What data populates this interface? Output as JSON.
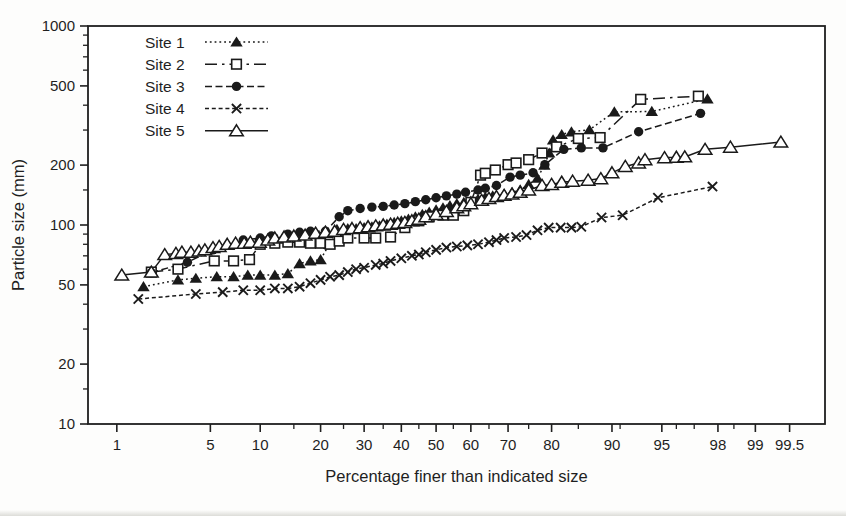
{
  "chart_data": {
    "type": "line",
    "title": "",
    "xlabel": "Percentage finer than indicated size",
    "ylabel": "Particle size (mm)",
    "x_scale": "normal-probability",
    "y_scale": "log",
    "xlim": [
      0.56,
      99.77
    ],
    "ylim": [
      10,
      1000
    ],
    "x_ticks_major": [
      1,
      5,
      10,
      20,
      30,
      40,
      50,
      60,
      70,
      80,
      90,
      95,
      98,
      99,
      99.5
    ],
    "x_tick_labels": [
      "1",
      "5",
      "10",
      "20",
      "30",
      "40",
      "50",
      "60",
      "70",
      "80",
      "90",
      "95",
      "98",
      "99",
      "99.5"
    ],
    "x_ticks_minor": [
      15,
      25,
      35,
      45,
      55,
      65,
      75,
      85,
      91,
      96,
      97,
      98.5
    ],
    "y_ticks_major": [
      10,
      20,
      50,
      100,
      200,
      500,
      1000
    ],
    "y_tick_labels": [
      "10",
      "20",
      "50",
      "100",
      "200",
      "500",
      "1000"
    ],
    "y_ticks_minor": [
      15,
      30,
      40,
      60,
      70,
      80,
      90,
      150,
      300,
      400,
      600,
      700,
      800,
      900
    ],
    "grid": false,
    "legend": {
      "position": "top-left-inside",
      "entries": [
        "Site 1",
        "Site 2",
        "Site 3",
        "Site 4",
        "Site 5"
      ]
    },
    "colors": {
      "series": "#1a1a1a",
      "axis": "#1f1f1f",
      "background": "#fdfdfc",
      "marker_open_fill": "#ffffff"
    },
    "series": [
      {
        "name": "Site 1",
        "marker": "triangle-filled",
        "line": "dotted",
        "points": [
          [
            1.65,
            49
          ],
          [
            3,
            53
          ],
          [
            4,
            54
          ],
          [
            5.5,
            55
          ],
          [
            7,
            55
          ],
          [
            8.5,
            56
          ],
          [
            10,
            56
          ],
          [
            12,
            56
          ],
          [
            14,
            57
          ],
          [
            16,
            64
          ],
          [
            18,
            66
          ],
          [
            20,
            67
          ],
          [
            21.8,
            80
          ],
          [
            23.5,
            95
          ],
          [
            26,
            96
          ],
          [
            28,
            96
          ],
          [
            30,
            97
          ],
          [
            32,
            98
          ],
          [
            34,
            99
          ],
          [
            36,
            101
          ],
          [
            38,
            103
          ],
          [
            40,
            105
          ],
          [
            42,
            107
          ],
          [
            44,
            110
          ],
          [
            46,
            113
          ],
          [
            48,
            116
          ],
          [
            50,
            119
          ],
          [
            52,
            122
          ],
          [
            54,
            125
          ],
          [
            56,
            128
          ],
          [
            58,
            130
          ],
          [
            60,
            132
          ],
          [
            62,
            135
          ],
          [
            64,
            138
          ],
          [
            66,
            140
          ],
          [
            69,
            143
          ],
          [
            71,
            146
          ],
          [
            73,
            150
          ],
          [
            75,
            160
          ],
          [
            77,
            172
          ],
          [
            78.5,
            200
          ],
          [
            79.5,
            230
          ],
          [
            80.3,
            268
          ],
          [
            82,
            285
          ],
          [
            83.8,
            294
          ],
          [
            86.8,
            301
          ],
          [
            90.3,
            370
          ],
          [
            94.2,
            372
          ],
          [
            97.6,
            430
          ]
        ]
      },
      {
        "name": "Site 2",
        "marker": "square-open",
        "line": "long-dash-dot",
        "points": [
          [
            1.9,
            58
          ],
          [
            3,
            60
          ],
          [
            5.3,
            66
          ],
          [
            7,
            66
          ],
          [
            8.7,
            67
          ],
          [
            10,
            80
          ],
          [
            12,
            81
          ],
          [
            14,
            82
          ],
          [
            16,
            82
          ],
          [
            18,
            81
          ],
          [
            20,
            81
          ],
          [
            22,
            80
          ],
          [
            24,
            83
          ],
          [
            26,
            86
          ],
          [
            30,
            86
          ],
          [
            33,
            86
          ],
          [
            37,
            87
          ],
          [
            41,
            97
          ],
          [
            45,
            105
          ],
          [
            48,
            110
          ],
          [
            52,
            112
          ],
          [
            55,
            112
          ],
          [
            58,
            118
          ],
          [
            60,
            130
          ],
          [
            62.7,
            178
          ],
          [
            64,
            182
          ],
          [
            66.7,
            189
          ],
          [
            70,
            201
          ],
          [
            72,
            205
          ],
          [
            75,
            213
          ],
          [
            78,
            230
          ],
          [
            81,
            247
          ],
          [
            85,
            272
          ],
          [
            88.4,
            275
          ],
          [
            93.2,
            428
          ],
          [
            97.2,
            444
          ]
        ]
      },
      {
        "name": "Site 3",
        "marker": "circle-filled",
        "line": "dash",
        "points": [
          [
            1.9,
            57.5
          ],
          [
            3.5,
            65
          ],
          [
            5.2,
            75
          ],
          [
            8,
            84
          ],
          [
            10,
            86
          ],
          [
            11.5,
            88
          ],
          [
            14,
            90
          ],
          [
            16,
            92
          ],
          [
            18,
            93
          ],
          [
            21,
            93
          ],
          [
            24,
            110
          ],
          [
            26,
            118
          ],
          [
            29,
            121
          ],
          [
            32,
            123
          ],
          [
            35,
            124
          ],
          [
            38,
            126
          ],
          [
            41,
            128
          ],
          [
            44,
            131
          ],
          [
            47,
            134
          ],
          [
            50,
            137
          ],
          [
            53,
            140
          ],
          [
            56,
            143
          ],
          [
            58.5,
            146
          ],
          [
            62,
            150
          ],
          [
            64,
            153
          ],
          [
            67,
            158
          ],
          [
            70.5,
            174
          ],
          [
            73,
            178
          ],
          [
            76,
            183
          ],
          [
            78.6,
            201
          ],
          [
            82.4,
            240
          ],
          [
            85.5,
            244
          ],
          [
            88.8,
            244
          ],
          [
            93,
            294
          ],
          [
            97.3,
            364
          ]
        ]
      },
      {
        "name": "Site 4",
        "marker": "x-cross",
        "line": "short-dash",
        "points": [
          [
            1.5,
            42.5
          ],
          [
            4,
            45
          ],
          [
            6,
            46
          ],
          [
            8,
            47
          ],
          [
            10,
            47
          ],
          [
            12,
            48
          ],
          [
            14,
            48
          ],
          [
            16,
            49
          ],
          [
            18,
            51
          ],
          [
            20,
            53
          ],
          [
            22,
            55
          ],
          [
            24,
            56
          ],
          [
            26,
            58
          ],
          [
            28,
            60
          ],
          [
            30,
            61
          ],
          [
            33,
            63
          ],
          [
            35,
            64
          ],
          [
            37,
            66
          ],
          [
            40,
            68
          ],
          [
            43,
            70
          ],
          [
            45,
            71
          ],
          [
            47,
            73
          ],
          [
            50,
            75
          ],
          [
            53,
            77
          ],
          [
            56,
            78
          ],
          [
            59,
            79
          ],
          [
            62,
            80
          ],
          [
            65,
            82
          ],
          [
            67,
            84
          ],
          [
            69,
            86
          ],
          [
            72,
            87
          ],
          [
            74.5,
            89
          ],
          [
            77,
            94
          ],
          [
            79.4,
            97
          ],
          [
            81.8,
            97
          ],
          [
            83.8,
            97
          ],
          [
            85.5,
            98
          ],
          [
            88.6,
            109
          ],
          [
            91.3,
            112
          ],
          [
            94.7,
            137
          ],
          [
            97.8,
            156
          ]
        ]
      },
      {
        "name": "Site 5",
        "marker": "triangle-open",
        "line": "solid",
        "points": [
          [
            1.1,
            56
          ],
          [
            1.9,
            58
          ],
          [
            2.4,
            71
          ],
          [
            2.9,
            72
          ],
          [
            3.2,
            73
          ],
          [
            3.7,
            73
          ],
          [
            4.2,
            74
          ],
          [
            4.6,
            75
          ],
          [
            5.2,
            77
          ],
          [
            5.7,
            78
          ],
          [
            6.4,
            80
          ],
          [
            7.2,
            81
          ],
          [
            8.1,
            81
          ],
          [
            8.8,
            82
          ],
          [
            9.9,
            82
          ],
          [
            11,
            84
          ],
          [
            12,
            86
          ],
          [
            13.4,
            87
          ],
          [
            15,
            88
          ],
          [
            17,
            89
          ],
          [
            19,
            91
          ],
          [
            21,
            92
          ],
          [
            23,
            93
          ],
          [
            25,
            95
          ],
          [
            27,
            96
          ],
          [
            29,
            97
          ],
          [
            31,
            98
          ],
          [
            33,
            99
          ],
          [
            35,
            100
          ],
          [
            37,
            101
          ],
          [
            39,
            102
          ],
          [
            41,
            103
          ],
          [
            43,
            105
          ],
          [
            45,
            107
          ],
          [
            47,
            110
          ],
          [
            50,
            113
          ],
          [
            53,
            117
          ],
          [
            56,
            122
          ],
          [
            58,
            125
          ],
          [
            60,
            128
          ],
          [
            63,
            133
          ],
          [
            65,
            136
          ],
          [
            67,
            139
          ],
          [
            69,
            141
          ],
          [
            71,
            143
          ],
          [
            73,
            146
          ],
          [
            75,
            150
          ],
          [
            78,
            158
          ],
          [
            80,
            160
          ],
          [
            82,
            164
          ],
          [
            84,
            166
          ],
          [
            86.6,
            168
          ],
          [
            88.5,
            171
          ],
          [
            90,
            183
          ],
          [
            91.6,
            197
          ],
          [
            93,
            205
          ],
          [
            93.6,
            213
          ],
          [
            95.2,
            218
          ],
          [
            96,
            219
          ],
          [
            96.5,
            220
          ],
          [
            97.5,
            240
          ],
          [
            98.4,
            246
          ],
          [
            99.4,
            261
          ]
        ]
      }
    ]
  }
}
